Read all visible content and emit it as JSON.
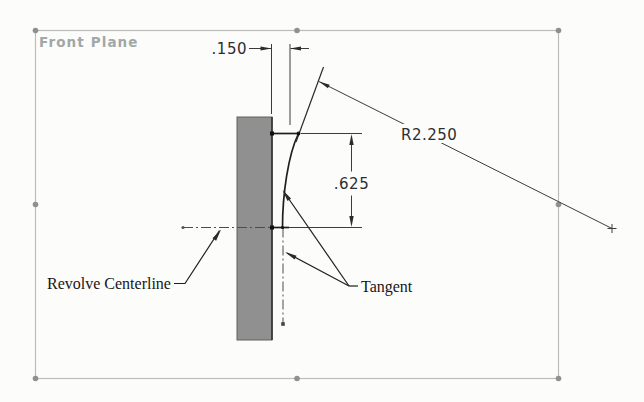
{
  "plane": {
    "label": "Front Plane",
    "border_color": "#bcbcbc",
    "handle_color": "#8d9191",
    "label_color": "#a2a7a7"
  },
  "sketch": {
    "section_fill": "#909090",
    "entity_color": "#1f1f1f",
    "centerline_color": "#4d4d4d"
  },
  "dimensions": {
    "thickness": {
      "value": ".150"
    },
    "height": {
      "value": ".625"
    },
    "radius": {
      "value": "R2.250"
    }
  },
  "annotations": {
    "centerline_label": "Revolve Centerline",
    "tangent_label": "Tangent"
  }
}
